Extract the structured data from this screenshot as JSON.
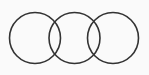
{
  "diagram": {
    "type": "overlapping-circles",
    "background": "#fafafa",
    "stroke_color": "#333333",
    "stroke_width": 1.6,
    "circles": [
      {
        "cx": 35,
        "cy": 38,
        "r": 25.5
      },
      {
        "cx": 74.5,
        "cy": 38,
        "r": 25.5
      },
      {
        "cx": 113,
        "cy": 38,
        "r": 25.5
      }
    ]
  }
}
